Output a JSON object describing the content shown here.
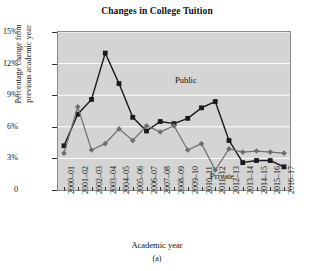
{
  "figure": {
    "caption": "(a)"
  },
  "chart_data": {
    "type": "line",
    "title": "Changes in College Tuition",
    "xlabel": "Academic year",
    "ylabel": "Percentage change from previous academic year",
    "ylabel_line1": "Percentage change from",
    "ylabel_line2": "previous academic year",
    "grid": true,
    "legend_position": "inline-annotation",
    "ylim": [
      0,
      15
    ],
    "yticks": [
      0,
      3,
      6,
      9,
      12,
      15
    ],
    "ytick_labels": [
      "0",
      "3%",
      "6%",
      "9%",
      "12%",
      "15%"
    ],
    "categories": [
      "2000–01",
      "2001–02",
      "2002–03",
      "2003–04",
      "2004–05",
      "2005–06",
      "2006–07",
      "2007–08",
      "2008–09",
      "2009–10",
      "2010–11",
      "2011–12",
      "2012–13",
      "2013–14",
      "2014–15",
      "2015–16",
      "2016–17"
    ],
    "series": [
      {
        "name": "Public",
        "color": "#1a1a1a",
        "marker": "square",
        "values": [
          4.2,
          7.2,
          8.6,
          13.0,
          10.1,
          6.9,
          5.6,
          6.5,
          6.3,
          6.8,
          7.8,
          8.4,
          4.7,
          2.6,
          2.8,
          2.8,
          2.2
        ]
      },
      {
        "name": "Private",
        "color": "#6e6e6e",
        "marker": "diamond",
        "values": [
          3.5,
          7.9,
          3.8,
          4.4,
          5.8,
          4.7,
          6.1,
          5.5,
          6.1,
          3.8,
          4.4,
          1.9,
          3.9,
          3.6,
          3.7,
          3.6,
          3.5
        ]
      }
    ],
    "annotations": [
      {
        "text": "Public",
        "series": "Public"
      },
      {
        "text": "Private",
        "series": "Private"
      }
    ],
    "plot_background": "#d4d4d4",
    "gridline_color": "#ffffff"
  }
}
